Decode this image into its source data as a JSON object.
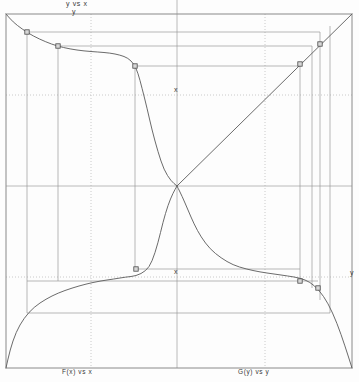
{
  "figure": {
    "title_top": "y vs x",
    "labels": {
      "axis_y_top": "y",
      "axis_x_upper": "x",
      "axis_x_lower": "x",
      "axis_y_right": "y",
      "caption_bottom_left": "F(x) vs x",
      "caption_bottom_right": "G(y) vs y"
    },
    "colors": {
      "curve": "#5a5a5a",
      "frame": "#8a8a8a",
      "grid_solid": "#a8a8a8",
      "grid_dotted": "#bdbdbd",
      "guide": "#9a9a9a",
      "marker_fill": "#d8d8d8",
      "marker_stroke": "#4a4a4a",
      "text": "#3a3a3a",
      "background": "#ffffff"
    }
  },
  "chart_data": {
    "type": "line",
    "title": "y vs x",
    "xlabel": "x",
    "ylabel": "y",
    "grid": true,
    "legend_position": "none",
    "axis_ranges": {
      "x": [
        0,
        1
      ],
      "y": [
        0,
        1
      ]
    },
    "plot_frame_px": {
      "left": 6,
      "top": 14,
      "right": 352,
      "bottom": 368
    },
    "gridlines": {
      "solid_vertical_x": [
        177
      ],
      "solid_horizontal_y": [
        186
      ],
      "dotted_vertical_x": [
        91,
        265
      ],
      "dotted_horizontal_y": [
        95,
        277
      ]
    },
    "series": [
      {
        "name": "y vs x (descending sigmoid, upper-left quadrant)",
        "type": "line",
        "points_px": [
          [
            6,
            14
          ],
          [
            13,
            22
          ],
          [
            22,
            29
          ],
          [
            33,
            36
          ],
          [
            46,
            42
          ],
          [
            57,
            46
          ],
          [
            70,
            49
          ],
          [
            84,
            51
          ],
          [
            98,
            52
          ],
          [
            110,
            53
          ],
          [
            120,
            55
          ],
          [
            128,
            58
          ],
          [
            134,
            64
          ],
          [
            138,
            73
          ],
          [
            142,
            88
          ],
          [
            147,
            108
          ],
          [
            152,
            130
          ],
          [
            158,
            152
          ],
          [
            164,
            170
          ],
          [
            171,
            181
          ],
          [
            177,
            186
          ]
        ]
      },
      {
        "name": "F(x) vs x (ascending curve, lower-left quadrant)",
        "type": "line",
        "points_px": [
          [
            6,
            368
          ],
          [
            10,
            350
          ],
          [
            16,
            332
          ],
          [
            24,
            318
          ],
          [
            34,
            307
          ],
          [
            46,
            299
          ],
          [
            58,
            293
          ],
          [
            72,
            288
          ],
          [
            86,
            284
          ],
          [
            100,
            281
          ],
          [
            114,
            279
          ],
          [
            126,
            277
          ],
          [
            136,
            276
          ],
          [
            146,
            271
          ],
          [
            152,
            262
          ],
          [
            158,
            243
          ],
          [
            163,
            222
          ],
          [
            168,
            205
          ],
          [
            173,
            193
          ],
          [
            177,
            186
          ]
        ]
      },
      {
        "name": "G(y) vs y (descending tail, lower-right quadrant)",
        "type": "line",
        "points_px": [
          [
            177,
            186
          ],
          [
            182,
            196
          ],
          [
            188,
            210
          ],
          [
            194,
            224
          ],
          [
            201,
            237
          ],
          [
            210,
            249
          ],
          [
            221,
            258
          ],
          [
            233,
            265
          ],
          [
            246,
            269
          ],
          [
            260,
            272
          ],
          [
            274,
            274
          ],
          [
            288,
            276
          ],
          [
            300,
            278
          ],
          [
            310,
            282
          ],
          [
            319,
            290
          ],
          [
            328,
            303
          ],
          [
            337,
            323
          ],
          [
            345,
            346
          ],
          [
            352,
            368
          ]
        ]
      },
      {
        "name": "identity diagonal (upper-right quadrant)",
        "type": "line",
        "points_px": [
          [
            177,
            186
          ],
          [
            352,
            14
          ]
        ]
      }
    ],
    "markers": [
      {
        "label": "p1",
        "x_px": 27,
        "y_px": 32
      },
      {
        "label": "p2",
        "x_px": 58,
        "y_px": 46
      },
      {
        "label": "p3",
        "x_px": 135,
        "y_px": 66
      },
      {
        "label": "p4",
        "x_px": 300,
        "y_px": 64
      },
      {
        "label": "p5",
        "x_px": 320,
        "y_px": 44
      },
      {
        "label": "p6",
        "x_px": 136,
        "y_px": 269
      },
      {
        "label": "p7",
        "x_px": 300,
        "y_px": 281
      },
      {
        "label": "p8",
        "x_px": 318,
        "y_px": 288
      }
    ],
    "guide_lines": {
      "horizontal_px": [
        {
          "y": 32,
          "x1": 27,
          "x2": 320
        },
        {
          "y": 46,
          "x1": 58,
          "x2": 312
        },
        {
          "y": 66,
          "x1": 135,
          "x2": 300
        },
        {
          "y": 269,
          "x1": 136,
          "x2": 300
        },
        {
          "y": 281,
          "x1": 27,
          "x2": 318
        },
        {
          "y": 313,
          "x1": 27,
          "x2": 330
        }
      ],
      "vertical_px": [
        {
          "x": 27,
          "y1": 32,
          "y2": 313
        },
        {
          "x": 58,
          "y1": 46,
          "y2": 281
        },
        {
          "x": 135,
          "y1": 66,
          "y2": 269
        },
        {
          "x": 300,
          "y1": 64,
          "y2": 281
        },
        {
          "x": 312,
          "y1": 46,
          "y2": 288
        },
        {
          "x": 320,
          "y1": 32,
          "y2": 300
        },
        {
          "x": 330,
          "y1": 26,
          "y2": 313
        }
      ]
    }
  }
}
